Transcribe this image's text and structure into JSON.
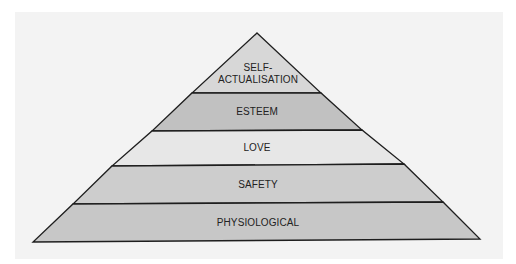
{
  "diagram": {
    "type": "pyramid",
    "title": "",
    "levels": [
      {
        "id": "self-actualisation",
        "line1": "SELF-",
        "line2": "ACTUALISATION",
        "fill": "#d7d7d7"
      },
      {
        "id": "esteem",
        "label": "ESTEEM",
        "fill": "#c1c1c1"
      },
      {
        "id": "love",
        "label": "LOVE",
        "fill": "#e7e7e7"
      },
      {
        "id": "safety",
        "label": "SAFETY",
        "fill": "#cdcdcd"
      },
      {
        "id": "physiological",
        "label": "PHYSIOLOGICAL",
        "fill": "#c7c7c7"
      }
    ],
    "colors": {
      "background": "#ffffff",
      "panel": "#f3f3f3",
      "outline": "#1e1e1e",
      "text": "#222222"
    }
  }
}
